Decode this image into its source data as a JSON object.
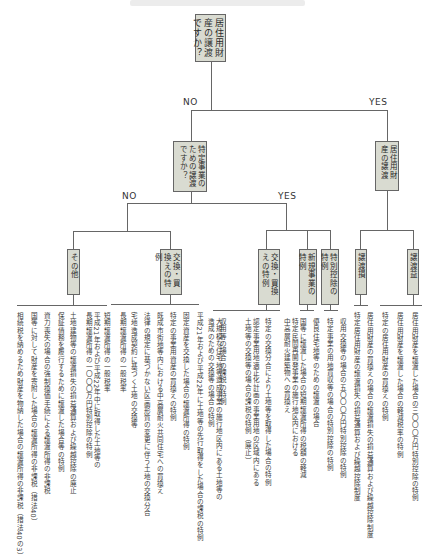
{
  "root": {
    "question": "居住用財産の譲渡ですか？"
  },
  "labels": {
    "no": "NO",
    "yes": "YES"
  },
  "level1": {
    "no_question": "特定事業のための譲渡ですか？",
    "yes_box": "居住用財産の譲渡"
  },
  "level2": {
    "other": "その他",
    "exchange_no": "交換・買換えの特例",
    "exchange_yes": "交換・買換えの特例",
    "new_project": "新規事業の特例",
    "special_deduction": "特別控除の特例",
    "gain": "譲渡益",
    "loss": "譲渡損"
  },
  "leaves": {
    "other": [
      "短期譲渡所得の一般税率",
      "平成21年および平成22年中に取得した土地等の\n長期譲渡所得の一〇〇〇万円特別控除の特例",
      "長期譲渡所得の一般税率",
      "土地建物等の譲渡損失の損益通算および繰越控除の廃止",
      "保証債務を履行するために譲渡した場合等の特例",
      "資力喪失の場合の強制換価手続による譲渡所得の非課税",
      "国等に対して財産を寄附した場合の譲渡所得の非課税（措法40）",
      "相続税を納めるため財産を物納した場合の譲渡所得の非課税（措法40の3）"
    ],
    "exchange_no": [
      "固定資産を交換した場合の譲渡所得の特例",
      "特定の事業用資産の買換えの特例",
      "既成市街地等内における中高層耐火共同住宅への買換え",
      "法律の規定に基づかない区画形質の変更に伴う土地の交換分合",
      "宅地造成契約に基づく土地の交換等"
    ],
    "exchange_no_extra": [
      "特定の事業用資産の買換えの特例",
      "固定資産を交換した場合の譲渡所得の特例",
      "平成21年および平成22年に土地等の先行取得をした場合の課税の特例"
    ],
    "exchange_yes": [
      "収用等の場合の課税の特例",
      "大規模な住宅地等造成事業の施行地区内にある土地等の\n造成のための交換等の場合の特例",
      "認定事業用地適正化計画の事業用地の区域内にある\n土地等の交換等の場合の課税の特例（廃止）",
      "特定の交換分合により土地等を取得した場合の特例",
      "特定民間再開発事業の施行地区内における\n中高層耐火建築物への買換え"
    ],
    "new_project": [
      "国等に譲渡した場合の短期譲渡所得の税額の軽減",
      "優良住宅地等のための譲渡の場合"
    ],
    "special_deduction": [
      "特定事業の用地買収等の場合の特別控除の特例",
      "収用交換等の場合の五〇〇〇万円特別控除の特例"
    ],
    "loss": [
      "特定居住用財産の譲渡損失の損益通算および繰越控除制度",
      "居住用財産の買換えの場合の譲渡損失の損益通算および繰越控除制度"
    ],
    "gain": [
      "特定の居住用財産の買換えの特例",
      "居住用財産を譲渡した場合の軽減税率の特例",
      "居住用財産を譲渡した場合の三〇〇〇万円特別控除の特例"
    ]
  }
}
